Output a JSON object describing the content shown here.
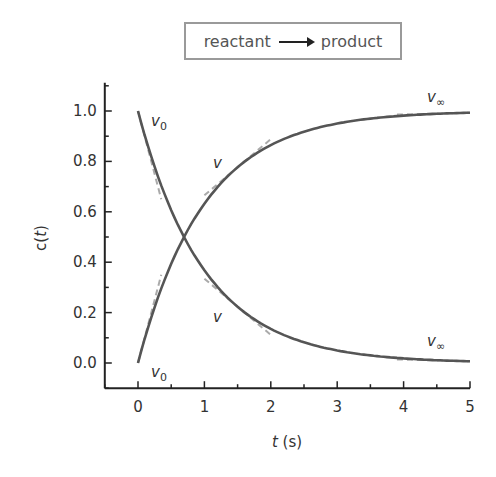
{
  "legend": {
    "left": "reactant",
    "right": "product",
    "arrow_icon": "right-arrow-icon"
  },
  "axes": {
    "xlabel_var": "t",
    "xlabel_unit": " (s)",
    "ylabel_var": "c(t)",
    "xticks": [
      "0",
      "1",
      "2",
      "3",
      "4",
      "5"
    ],
    "yticks": [
      "0.0",
      "0.2",
      "0.4",
      "0.6",
      "0.8",
      "1.0"
    ]
  },
  "annotations": {
    "v0_top": "v",
    "v0_top_sub": "0",
    "v_mid_upper": "v",
    "v_inf_upper": "v",
    "v_inf_upper_sub": "∞",
    "v_mid_lower": "v",
    "v0_bottom": "v",
    "v0_bottom_sub": "0",
    "v_inf_lower": "v",
    "v_inf_lower_sub": "∞"
  },
  "colors": {
    "curve": "#555555",
    "tangent": "#aaaaaa",
    "axis": "#222222",
    "box_border": "#9a9a9a"
  },
  "chart_data": {
    "type": "line",
    "xlabel": "t (s)",
    "ylabel": "c(t)",
    "xlim": [
      -0.5,
      5
    ],
    "ylim": [
      -0.1,
      1.1
    ],
    "grid": false,
    "legend_position": "top (boxed)",
    "x": [
      0,
      0.25,
      0.5,
      0.75,
      1,
      1.5,
      2,
      2.5,
      3,
      3.5,
      4,
      4.5,
      5
    ],
    "series": [
      {
        "name": "reactant",
        "values": [
          1.0,
          0.78,
          0.61,
          0.47,
          0.37,
          0.22,
          0.14,
          0.08,
          0.05,
          0.03,
          0.02,
          0.01,
          0.007
        ]
      },
      {
        "name": "product",
        "values": [
          0.0,
          0.22,
          0.39,
          0.53,
          0.63,
          0.78,
          0.86,
          0.92,
          0.95,
          0.97,
          0.98,
          0.99,
          0.993
        ]
      }
    ],
    "annotations": [
      {
        "text": "v0",
        "at": [
          0.1,
          1.0
        ],
        "note": "initial rate tangent (reactant)"
      },
      {
        "text": "v",
        "at": [
          1.2,
          0.75
        ],
        "note": "rate tangent (product)"
      },
      {
        "text": "v∞",
        "at": [
          4.4,
          1.03
        ],
        "note": "final rate tangent (product)"
      },
      {
        "text": "v",
        "at": [
          1.2,
          0.25
        ],
        "note": "rate tangent (reactant)"
      },
      {
        "text": "v0",
        "at": [
          0.2,
          -0.05
        ],
        "note": "initial rate tangent (product)"
      },
      {
        "text": "v∞",
        "at": [
          4.4,
          0.06
        ],
        "note": "final rate tangent (reactant)"
      }
    ]
  }
}
